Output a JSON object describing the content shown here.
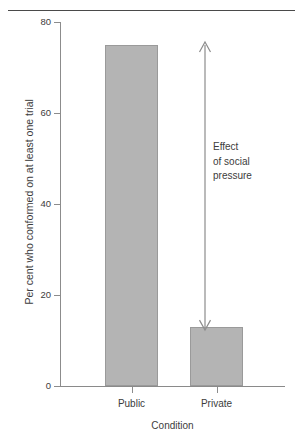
{
  "chart_data": {
    "type": "bar",
    "title": "",
    "subtitle": "",
    "categories": [
      "Public",
      "Private"
    ],
    "values": [
      75,
      13
    ],
    "series": [
      {
        "name": "Per cent who conformed on at least one trial",
        "values": [
          75,
          13
        ]
      }
    ],
    "xlabel": "Condition",
    "ylabel": "Per cent who conformed on at least one trial",
    "ylim": [
      0,
      80
    ],
    "yticks": [
      0,
      20,
      40,
      60,
      80
    ],
    "ytick_labels": [
      "0",
      "20",
      "40",
      "60",
      "80"
    ],
    "grid": false,
    "legend": false,
    "legend_position": "none",
    "bar_color": "#b4b4b4",
    "bar_edge_color": "#9a9a9a",
    "axis_color": "#8c8c8c",
    "text_color": "#3c3c3c",
    "annotations": [
      {
        "name": "effect-of-social-pressure",
        "lines": [
          "Effect",
          "of social",
          "pressure"
        ],
        "arrow": "double-headed-vertical",
        "from_value": 75,
        "to_value": 13
      }
    ]
  },
  "figure": {
    "top_rule_color": "#4a4a4a"
  },
  "axes": {
    "y_title": "Per cent who conformed on at least one trial",
    "x_title": "Condition",
    "y_tick_labels": [
      "80",
      "60",
      "40",
      "20",
      "0"
    ],
    "x_tick_labels": [
      "Public",
      "Private"
    ]
  },
  "annotation": {
    "line1": "Effect",
    "line2": "of social",
    "line3": "pressure"
  }
}
